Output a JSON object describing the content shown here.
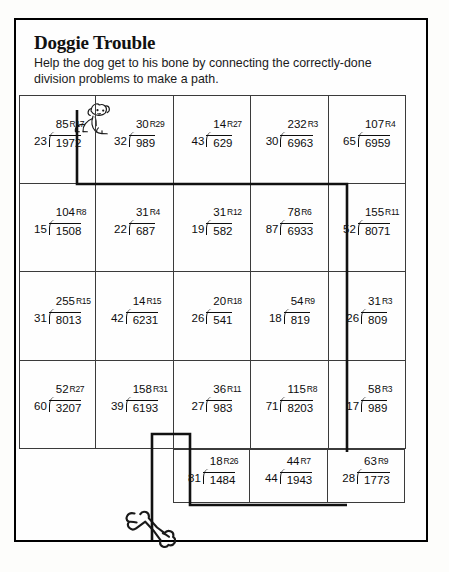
{
  "worksheet": {
    "title": "Doggie Trouble",
    "instructions": "Help the dog get to his bone by connecting the correctly-done division problems to make a path.",
    "remainder_prefix": "R",
    "ink_color": "#0d0d0d",
    "grid_line_color": "#3b3b3b",
    "path_color": "#111111"
  },
  "art": {
    "dog": "dog-illustration",
    "bone": "bone-illustration"
  },
  "grid": {
    "columns": 5,
    "rows": 4,
    "rows_data": [
      [
        {
          "divisor": "23",
          "dividend": "1972",
          "quotient": "85",
          "remainder": "17"
        },
        {
          "divisor": "32",
          "dividend": "989",
          "quotient": "30",
          "remainder": "29"
        },
        {
          "divisor": "43",
          "dividend": "629",
          "quotient": "14",
          "remainder": "27"
        },
        {
          "divisor": "30",
          "dividend": "6963",
          "quotient": "232",
          "remainder": "3"
        },
        {
          "divisor": "65",
          "dividend": "6959",
          "quotient": "107",
          "remainder": "4"
        }
      ],
      [
        {
          "divisor": "15",
          "dividend": "1508",
          "quotient": "104",
          "remainder": "8"
        },
        {
          "divisor": "22",
          "dividend": "687",
          "quotient": "31",
          "remainder": "4"
        },
        {
          "divisor": "19",
          "dividend": "582",
          "quotient": "31",
          "remainder": "12"
        },
        {
          "divisor": "87",
          "dividend": "6933",
          "quotient": "78",
          "remainder": "6"
        },
        {
          "divisor": "52",
          "dividend": "8071",
          "quotient": "155",
          "remainder": "11"
        }
      ],
      [
        {
          "divisor": "31",
          "dividend": "8013",
          "quotient": "255",
          "remainder": "15"
        },
        {
          "divisor": "42",
          "dividend": "6231",
          "quotient": "14",
          "remainder": "15"
        },
        {
          "divisor": "26",
          "dividend": "541",
          "quotient": "20",
          "remainder": "18"
        },
        {
          "divisor": "18",
          "dividend": "819",
          "quotient": "54",
          "remainder": "9"
        },
        {
          "divisor": "26",
          "dividend": "809",
          "quotient": "31",
          "remainder": "3"
        }
      ],
      [
        {
          "divisor": "60",
          "dividend": "3207",
          "quotient": "52",
          "remainder": "27"
        },
        {
          "divisor": "39",
          "dividend": "6193",
          "quotient": "158",
          "remainder": "31"
        },
        {
          "divisor": "27",
          "dividend": "983",
          "quotient": "36",
          "remainder": "11"
        },
        {
          "divisor": "71",
          "dividend": "8203",
          "quotient": "115",
          "remainder": "8"
        },
        {
          "divisor": "17",
          "dividend": "989",
          "quotient": "58",
          "remainder": "3"
        }
      ]
    ],
    "bottom_row": [
      {
        "divisor": "81",
        "dividend": "1484",
        "quotient": "18",
        "remainder": "26"
      },
      {
        "divisor": "44",
        "dividend": "1943",
        "quotient": "44",
        "remainder": "7"
      },
      {
        "divisor": "28",
        "dividend": "1773",
        "quotient": "63",
        "remainder": "9"
      }
    ]
  }
}
